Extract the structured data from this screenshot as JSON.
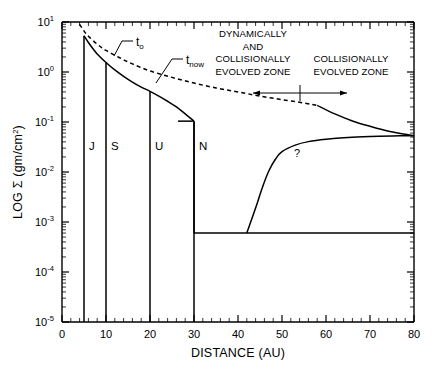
{
  "figure": {
    "title": "",
    "background_color": "#ffffff",
    "line_color": "#000000"
  },
  "axes": {
    "x": {
      "label": "DISTANCE (AU)",
      "tick_labels": [
        "0",
        "10",
        "20",
        "30",
        "40",
        "50",
        "60",
        "70",
        "80"
      ],
      "tick_values": [
        0,
        10,
        20,
        30,
        40,
        50,
        60,
        70,
        80
      ],
      "range": [
        0,
        80
      ],
      "minor_tick_step": 2
    },
    "y": {
      "label_prefix": "LOG ",
      "label_symbol": "Σ",
      "label_unit": " (gm/cm",
      "label_unit_exp": "2",
      "label_unit_close": ")",
      "label_full": "LOG Σ (gm/cm2)",
      "tick_labels": [
        "10",
        "10",
        "10",
        "10",
        "10",
        "10",
        "10"
      ],
      "tick_exponents": [
        "1",
        "0",
        "-1",
        "-2",
        "-3",
        "-4",
        "-5"
      ],
      "range_exponents": [
        -5,
        1
      ],
      "scale": "log"
    }
  },
  "annotations": {
    "curve_labels": [
      {
        "name": "t-zero-label",
        "base": "t",
        "sub": "o"
      },
      {
        "name": "t-now-label",
        "base": "t",
        "sub": "now"
      }
    ],
    "zone_left": {
      "lines": [
        "DYNAMICALLY",
        "AND",
        "COLLISIONALLY",
        "EVOLVED  ZONE"
      ]
    },
    "zone_right": {
      "lines": [
        "COLLISIONALLY",
        "EVOLVED ZONE"
      ]
    },
    "question_mark": "?",
    "planets": [
      {
        "label": "J",
        "distance_au": 5
      },
      {
        "label": "S",
        "distance_au": 10
      },
      {
        "label": "U",
        "distance_au": 20
      },
      {
        "label": "N",
        "distance_au": 30
      }
    ],
    "zone_divider_au": 48,
    "zone_arrow_span_au": [
      34,
      64
    ]
  },
  "chart_data": {
    "type": "line",
    "title": "",
    "xlabel": "DISTANCE (AU)",
    "ylabel": "LOG Σ (gm/cm2)",
    "xlim": [
      0,
      80
    ],
    "ylim_exponents": [
      -5,
      1
    ],
    "yscale": "log",
    "grid": false,
    "legend": "inline-labels",
    "series": [
      {
        "name": "t_o",
        "style": "dashed",
        "description": "Initial surface density profile, declining power law from ~9 gm/cm2 at 4 AU to ~0.055 gm/cm2 at 80 AU",
        "points_au_sigma": [
          [
            4.0,
            9.0
          ],
          [
            5.0,
            6.6
          ],
          [
            6.0,
            5.2
          ],
          [
            8.0,
            3.6
          ],
          [
            10.0,
            2.7
          ],
          [
            13.0,
            1.95
          ],
          [
            16.0,
            1.45
          ],
          [
            20.0,
            1.05
          ],
          [
            25.0,
            0.78
          ],
          [
            30.0,
            0.6
          ],
          [
            35.0,
            0.48
          ],
          [
            40.0,
            0.4
          ],
          [
            45.0,
            0.33
          ],
          [
            50.0,
            0.28
          ],
          [
            55.0,
            0.24
          ],
          [
            58.0,
            0.215
          ]
        ]
      },
      {
        "name": "t_now_inner",
        "style": "solid",
        "description": "Present-day surface density inside Neptune, steeper decline from ~5.3 gm/cm2 at 5 AU to ~0.1 gm/cm2 at 30 AU, then truncated vertically to the floor",
        "points_au_sigma": [
          [
            5.0,
            5.3
          ],
          [
            6.0,
            3.9
          ],
          [
            7.0,
            2.95
          ],
          [
            8.0,
            2.3
          ],
          [
            10.0,
            1.55
          ],
          [
            12.0,
            1.1
          ],
          [
            14.0,
            0.82
          ],
          [
            16.0,
            0.63
          ],
          [
            18.0,
            0.5
          ],
          [
            20.0,
            0.41
          ],
          [
            22.0,
            0.33
          ],
          [
            24.0,
            0.26
          ],
          [
            26.0,
            0.2
          ],
          [
            28.0,
            0.145
          ],
          [
            30.0,
            0.104
          ]
        ]
      },
      {
        "name": "t_now_outer",
        "style": "solid",
        "description": "Extrapolated outer tail continuing from the dashed t_o curve to the right plot edge",
        "points_au_sigma": [
          [
            58.0,
            0.215
          ],
          [
            62.0,
            0.145
          ],
          [
            66.0,
            0.105
          ],
          [
            70.0,
            0.082
          ],
          [
            74.0,
            0.066
          ],
          [
            78.0,
            0.057
          ],
          [
            80.0,
            0.053
          ]
        ]
      },
      {
        "name": "kuiper_belt_floor",
        "style": "solid",
        "description": "Observed low surface-density floor beyond Neptune at about 6e-4 gm/cm2",
        "sigma_value": 0.0006,
        "x_range_au": [
          30,
          80
        ]
      },
      {
        "name": "unknown_rise",
        "style": "solid",
        "description": "Speculative rise (marked ?) from the floor near 42 AU up to join the outer tail near 80 AU",
        "points_au_sigma": [
          [
            42.0,
            0.0006
          ],
          [
            44.0,
            0.0019
          ],
          [
            45.5,
            0.0048
          ],
          [
            47.0,
            0.0105
          ],
          [
            48.5,
            0.018
          ],
          [
            50.0,
            0.0255
          ],
          [
            53.0,
            0.0345
          ],
          [
            56.0,
            0.0405
          ],
          [
            60.0,
            0.0452
          ],
          [
            65.0,
            0.049
          ],
          [
            70.0,
            0.0512
          ],
          [
            75.0,
            0.0525
          ],
          [
            80.0,
            0.0532
          ]
        ]
      }
    ],
    "vertical_markers": [
      {
        "label": "J",
        "x_au": 5,
        "sigma_top": 5.3,
        "sigma_bottom": 1e-05
      },
      {
        "label": "S",
        "x_au": 10,
        "sigma_top": 1.55,
        "sigma_bottom": 1e-05
      },
      {
        "label": "U",
        "x_au": 20,
        "sigma_top": 0.41,
        "sigma_bottom": 1e-05
      },
      {
        "label": "N",
        "x_au": 30,
        "sigma_top": 0.104,
        "sigma_bottom": 1e-05
      }
    ]
  }
}
